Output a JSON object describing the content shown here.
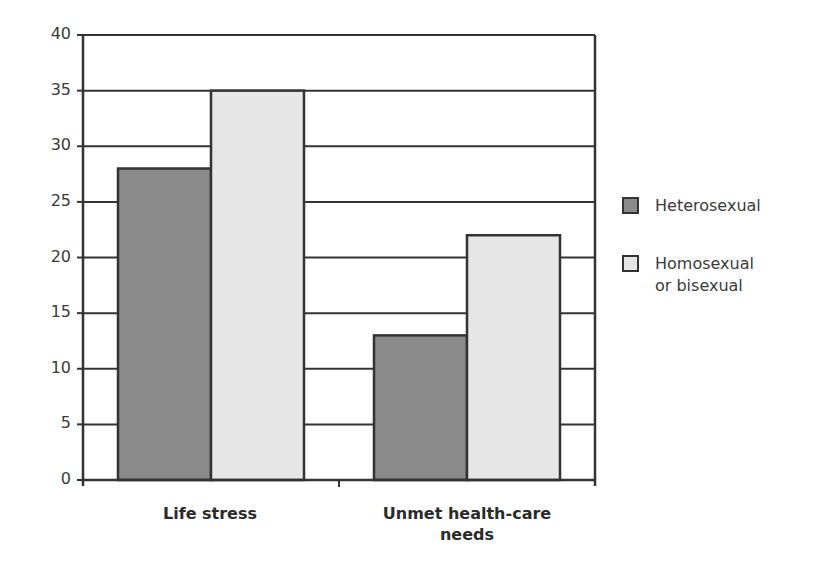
{
  "chart_data": {
    "type": "bar",
    "title": "",
    "xlabel": "",
    "ylabel": "",
    "categories": [
      "Life stress",
      "Unmet health-care needs"
    ],
    "series": [
      {
        "name": "Heterosexual",
        "values": [
          28,
          13
        ],
        "color": "#8a8a8a"
      },
      {
        "name": "Homosexual or bisexual",
        "values": [
          35,
          22
        ],
        "color": "#e6e6e6"
      }
    ],
    "ylim": [
      0,
      40
    ],
    "yticks": [
      0,
      5,
      10,
      15,
      20,
      25,
      30,
      35,
      40
    ],
    "grid": true,
    "legend_position": "right"
  },
  "axis": {
    "ytick_labels": [
      "0",
      "5",
      "10",
      "15",
      "20",
      "25",
      "30",
      "35",
      "40"
    ]
  },
  "categories": {
    "cat0_label": "Life stress",
    "cat1_line1": "Unmet health-care",
    "cat1_line2": "needs"
  },
  "legend": {
    "item0": "Heterosexual",
    "item1_line1": "Homosexual",
    "item1_line2": "or bisexual"
  },
  "colors": {
    "heterosexual": "#8a8a8a",
    "homosexual_bisexual": "#e6e6e6",
    "axis": "#333333"
  }
}
